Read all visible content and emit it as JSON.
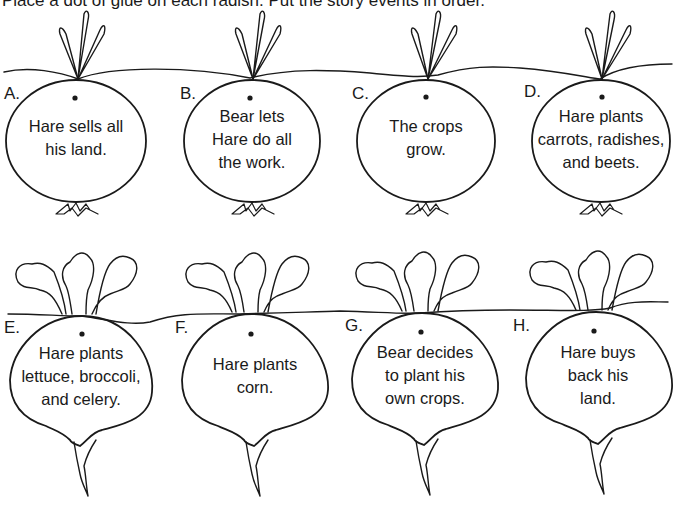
{
  "instructions": "Place a dot of glue on each radish. Put the story events in order.",
  "colors": {
    "ink": "#1a1a1a",
    "paper": "#ffffff"
  },
  "radishes": [
    {
      "letter": "A.",
      "lines": [
        "Hare sells all",
        "his land."
      ],
      "type": "round"
    },
    {
      "letter": "B.",
      "lines": [
        "Bear lets",
        "Hare do all",
        "the work."
      ],
      "type": "round"
    },
    {
      "letter": "C.",
      "lines": [
        "The crops",
        "grow."
      ],
      "type": "round"
    },
    {
      "letter": "D.",
      "lines": [
        "Hare plants",
        "carrots, radishes,",
        "and beets."
      ],
      "type": "round"
    },
    {
      "letter": "E.",
      "lines": [
        "Hare plants",
        "lettuce, broccoli,",
        "and celery."
      ],
      "type": "beet"
    },
    {
      "letter": "F.",
      "lines": [
        "Hare plants",
        "corn."
      ],
      "type": "beet"
    },
    {
      "letter": "G.",
      "lines": [
        "Bear decides",
        "to plant his",
        "own crops."
      ],
      "type": "beet"
    },
    {
      "letter": "H.",
      "lines": [
        "Hare buys",
        "back his",
        "land."
      ],
      "type": "beet"
    }
  ]
}
